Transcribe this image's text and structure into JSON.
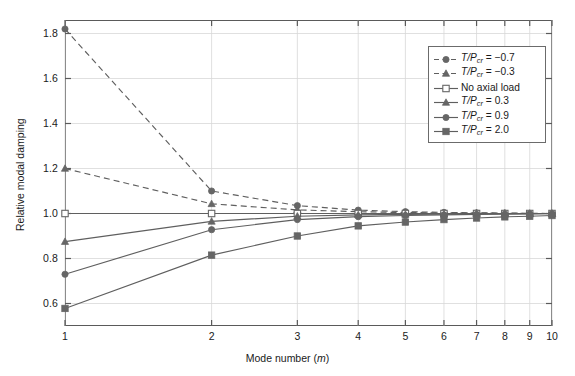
{
  "chart_data": {
    "type": "line",
    "title": "",
    "xlabel": "Mode number (m)",
    "ylabel": "Relative modal damping",
    "xscale": "log",
    "xlim": [
      1,
      10
    ],
    "ylim": [
      0.5,
      1.86
    ],
    "grid": true,
    "legend_position": "upper right",
    "x": [
      1,
      2,
      3,
      4,
      5,
      6,
      7,
      8,
      9,
      10
    ],
    "xticks": [
      1,
      2,
      3,
      4,
      5,
      6,
      7,
      8,
      9,
      10
    ],
    "yticks": [
      0.6,
      0.8,
      1.0,
      1.2,
      1.4,
      1.6,
      1.8
    ],
    "series": [
      {
        "name": "T/Pcr = -0.7",
        "label_prefix": "T/P",
        "label_sub": "cr",
        "label_value": " = −0.7",
        "marker": "circle-filled",
        "linestyle": "dashed",
        "color": "#5f5f5f",
        "values": [
          1.82,
          1.1,
          1.035,
          1.015,
          1.008,
          1.005,
          1.003,
          1.002,
          1.001,
          1.0
        ]
      },
      {
        "name": "T/Pcr = -0.3",
        "label_prefix": "T/P",
        "label_sub": "cr",
        "label_value": " = −0.3",
        "marker": "triangle-filled",
        "linestyle": "dashed",
        "color": "#5f5f5f",
        "values": [
          1.2,
          1.043,
          1.016,
          1.008,
          1.004,
          1.003,
          1.002,
          1.001,
          1.0,
          1.0
        ]
      },
      {
        "name": "No axial load",
        "label_prefix": "No axial load",
        "label_sub": "",
        "label_value": "",
        "marker": "square-open",
        "linestyle": "solid",
        "color": "#5f5f5f",
        "values": [
          1.0,
          1.0,
          1.0,
          1.0,
          1.0,
          1.0,
          1.0,
          1.0,
          1.0,
          1.0
        ]
      },
      {
        "name": "T/Pcr = 0.3",
        "label_prefix": "T/P",
        "label_sub": "cr",
        "label_value": " = 0.3",
        "marker": "triangle-filled",
        "linestyle": "solid",
        "color": "#5f5f5f",
        "values": [
          0.875,
          0.965,
          0.988,
          0.994,
          0.996,
          0.997,
          0.998,
          0.999,
          0.999,
          1.0
        ]
      },
      {
        "name": "T/Pcr = 0.9",
        "label_prefix": "T/P",
        "label_sub": "cr",
        "label_value": " = 0.9",
        "marker": "circle-filled",
        "linestyle": "solid",
        "color": "#5f5f5f",
        "values": [
          0.73,
          0.928,
          0.973,
          0.986,
          0.991,
          0.994,
          0.996,
          0.997,
          0.998,
          0.999
        ]
      },
      {
        "name": "T/Pcr = 2.0",
        "label_prefix": "T/P",
        "label_sub": "cr",
        "label_value": " = 2.0",
        "marker": "square-filled",
        "linestyle": "solid",
        "color": "#5f5f5f",
        "values": [
          0.578,
          0.815,
          0.9,
          0.945,
          0.962,
          0.973,
          0.98,
          0.985,
          0.988,
          0.991
        ]
      }
    ]
  },
  "axis": {
    "ylabel": "Relative modal damping",
    "xlabel_pre": "Mode number (",
    "xlabel_var": "m",
    "xlabel_post": ")",
    "ytick_labels": [
      "1.8",
      "1.6",
      "1.4",
      "1.2",
      "1.0",
      "0.8",
      "0.6"
    ],
    "xtick_labels": [
      "1",
      "2",
      "3",
      "4",
      "5",
      "6",
      "7",
      "8",
      "9",
      "10"
    ]
  },
  "legend": {
    "items": [
      {
        "text": "T/P",
        "sub": "cr",
        "rest": " = −0.7",
        "italic": true
      },
      {
        "text": "T/P",
        "sub": "cr",
        "rest": " = −0.3",
        "italic": true
      },
      {
        "text": "No axial load",
        "sub": "",
        "rest": "",
        "italic": false
      },
      {
        "text": "T/P",
        "sub": "cr",
        "rest": " = 0.3",
        "italic": true
      },
      {
        "text": "T/P",
        "sub": "cr",
        "rest": " = 0.9",
        "italic": true
      },
      {
        "text": "T/P",
        "sub": "cr",
        "rest": " = 2.0",
        "italic": true
      }
    ]
  },
  "colors": {
    "line": "#5f5f5f",
    "marker": "#666666",
    "axis": "#5a5a5a",
    "grid": "#d8d8d8",
    "background": "#ffffff"
  }
}
